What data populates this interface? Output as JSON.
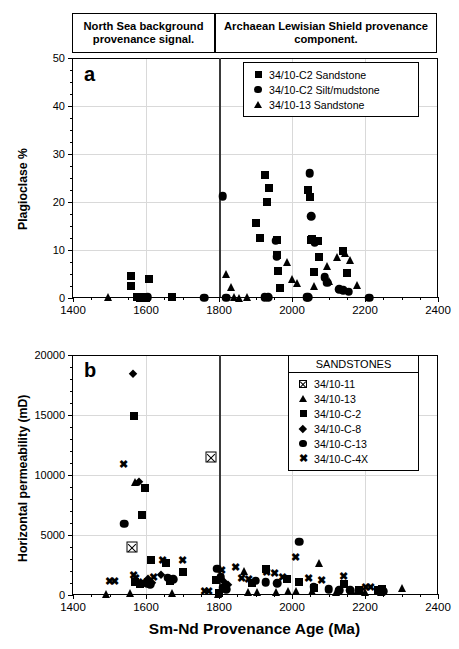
{
  "figure": {
    "header_left": "North Sea background provenance signal.",
    "header_right": "Archaean Lewisian Shield provenance component.",
    "divider_age": 1800,
    "xaxis_title": "Sm-Nd Provenance Age (Ma)"
  },
  "chart_data": [
    {
      "type": "scatter",
      "panel": "a",
      "title": "",
      "xlabel": "Sm-Nd Provenance Age (Ma)",
      "ylabel": "Plagioclase %",
      "xlim": [
        1400,
        2400
      ],
      "ylim": [
        0,
        50
      ],
      "xticks": [
        1400,
        1600,
        1800,
        2000,
        2200,
        2400
      ],
      "yticks": [
        0,
        10,
        20,
        30,
        40,
        50
      ],
      "xminor_step": 50,
      "yminor_step": 2.5,
      "grid": true,
      "legend_position": "top-right",
      "annotations": [
        {
          "text": "a",
          "x": 1432,
          "y": 46
        }
      ],
      "vline": 1800,
      "series": [
        {
          "name": "34/10-C2  Sandstone",
          "marker": "square",
          "points": [
            [
              1558,
              4.5
            ],
            [
              1558,
              2.6
            ],
            [
              1575,
              0.2
            ],
            [
              1583,
              0.1
            ],
            [
              1592,
              0.15
            ],
            [
              1600,
              0.1
            ],
            [
              1608,
              4.0
            ],
            [
              1672,
              0.2
            ],
            [
              1900,
              15.6
            ],
            [
              1913,
              12.5
            ],
            [
              1925,
              25.6
            ],
            [
              1938,
              23.0
            ],
            [
              1932,
              20.0
            ],
            [
              1958,
              12.0
            ],
            [
              1960,
              8.9
            ],
            [
              1962,
              5.6
            ],
            [
              1966,
              2.0
            ],
            [
              2045,
              22.5
            ],
            [
              2048,
              21.0
            ],
            [
              2052,
              12.0
            ],
            [
              2055,
              12.2
            ],
            [
              2060,
              5.4
            ],
            [
              2072,
              11.9
            ],
            [
              2075,
              8.6
            ],
            [
              2140,
              9.8
            ],
            [
              2150,
              5.2
            ]
          ]
        },
        {
          "name": "34/10-C2  Silt/mudstone",
          "marker": "circle",
          "points": [
            [
              1597,
              0.1
            ],
            [
              1605,
              0.15
            ],
            [
              1760,
              0.1
            ],
            [
              1810,
              21.2
            ],
            [
              1820,
              0.1
            ],
            [
              1925,
              0.15
            ],
            [
              1935,
              0.12
            ],
            [
              1942,
              41.3
            ],
            [
              1955,
              11.9
            ],
            [
              1958,
              8.6
            ],
            [
              2040,
              0.15
            ],
            [
              2045,
              0.2
            ],
            [
              2048,
              26.0
            ],
            [
              2052,
              17.0
            ],
            [
              2062,
              11.6
            ],
            [
              2090,
              4.3
            ],
            [
              2096,
              3.2
            ],
            [
              2130,
              1.8
            ],
            [
              2140,
              1.6
            ],
            [
              2155,
              1.3
            ],
            [
              2212,
              0.1
            ]
          ]
        },
        {
          "name": "34/10-13  Sandstone",
          "marker": "triangle",
          "points": [
            [
              1497,
              0.2
            ],
            [
              1820,
              5.0
            ],
            [
              1833,
              2.3
            ],
            [
              1878,
              0.15
            ],
            [
              1840,
              0.2
            ],
            [
              1855,
              0.1
            ],
            [
              1985,
              7.5
            ],
            [
              2000,
              4.0
            ],
            [
              2015,
              3.2
            ],
            [
              2060,
              2.6
            ],
            [
              2095,
              6.7
            ],
            [
              2100,
              3.5
            ],
            [
              2122,
              8.6
            ],
            [
              2145,
              9.4
            ],
            [
              2160,
              8.0
            ],
            [
              2178,
              2.8
            ]
          ]
        }
      ]
    },
    {
      "type": "scatter",
      "panel": "b",
      "title": "SANDSTONES",
      "xlabel": "Sm-Nd Provenance Age (Ma)",
      "ylabel": "Horizontal permeability (mD)",
      "xlim": [
        1400,
        2400
      ],
      "ylim": [
        0,
        20000
      ],
      "xticks": [
        1400,
        1600,
        1800,
        2000,
        2200,
        2400
      ],
      "yticks": [
        0,
        5000,
        10000,
        15000,
        20000
      ],
      "xminor_step": 50,
      "yminor_step": 1000,
      "grid": true,
      "legend_position": "top-right",
      "annotations": [
        {
          "text": "b",
          "x": 1432,
          "y": 18700
        }
      ],
      "vline": 1800,
      "series": [
        {
          "name": "34/10-11",
          "marker": "box-x",
          "points": [
            [
              1563,
              4000
            ],
            [
              1778,
              11500
            ]
          ]
        },
        {
          "name": "34/10-13",
          "marker": "triangle",
          "points": [
            [
              1490,
              120
            ],
            [
              1555,
              150
            ],
            [
              1570,
              9400
            ],
            [
              1672,
              190
            ],
            [
              1797,
              110
            ],
            [
              1868,
              1980
            ],
            [
              1880,
              230
            ],
            [
              1905,
              260
            ],
            [
              1955,
              290
            ],
            [
              1990,
              310
            ],
            [
              2010,
              330
            ],
            [
              2055,
              300
            ],
            [
              2075,
              2700
            ],
            [
              2120,
              280
            ],
            [
              2165,
              330
            ],
            [
              2200,
              290
            ],
            [
              2245,
              250
            ],
            [
              2300,
              600
            ]
          ]
        },
        {
          "name": "34/10-C-2",
          "marker": "square",
          "points": [
            [
              1568,
              14900
            ],
            [
              1597,
              8900
            ],
            [
              1589,
              6700
            ],
            [
              1570,
              1050
            ],
            [
              1583,
              900
            ],
            [
              1613,
              2950
            ],
            [
              1654,
              2700
            ],
            [
              1665,
              1200
            ],
            [
              1700,
              1900
            ],
            [
              1793,
              1250
            ],
            [
              1800,
              200
            ],
            [
              1890,
              1000
            ],
            [
              1930,
              2200
            ],
            [
              1985,
              1350
            ],
            [
              2020,
              1100
            ],
            [
              2060,
              600
            ],
            [
              2142,
              900
            ],
            [
              2183,
              450
            ],
            [
              2236,
              400
            ],
            [
              2247,
              500
            ]
          ]
        },
        {
          "name": "34/10-C-8",
          "marker": "diamond",
          "points": [
            [
              1565,
              18400
            ],
            [
              1580,
              9450
            ],
            [
              1605,
              1350
            ],
            [
              1617,
              1000
            ],
            [
              1640,
              1650
            ],
            [
              1803,
              1400
            ],
            [
              1815,
              1100
            ],
            [
              1826,
              800
            ]
          ]
        },
        {
          "name": "34/10-C-13",
          "marker": "circle",
          "points": [
            [
              1540,
              5950
            ],
            [
              1603,
              1000
            ],
            [
              1611,
              900
            ],
            [
              1660,
              1450
            ],
            [
              1675,
              1300
            ],
            [
              1795,
              2200
            ],
            [
              1805,
              1500
            ],
            [
              1812,
              600
            ],
            [
              1820,
              500
            ],
            [
              1900,
              1200
            ],
            [
              1928,
              1050
            ],
            [
              1960,
              1000
            ],
            [
              2020,
              4450
            ],
            [
              2060,
              700
            ],
            [
              2100,
              500
            ],
            [
              2130,
              420
            ],
            [
              2160,
              400
            ],
            [
              2250,
              330
            ]
          ]
        },
        {
          "name": "34/10-C-4X",
          "marker": "x",
          "points": [
            [
              1500,
              1200
            ],
            [
              1513,
              1150
            ],
            [
              1538,
              10900
            ],
            [
              1567,
              1700
            ],
            [
              1572,
              1450
            ],
            [
              1590,
              1100
            ],
            [
              1620,
              1500
            ],
            [
              1645,
              2900
            ],
            [
              1700,
              2900
            ],
            [
              1760,
              300
            ],
            [
              1770,
              320
            ],
            [
              1808,
              2100
            ],
            [
              1845,
              2300
            ],
            [
              1862,
              1400
            ],
            [
              1880,
              1350
            ],
            [
              1930,
              1900
            ],
            [
              1952,
              1850
            ],
            [
              1975,
              1500
            ],
            [
              2010,
              3200
            ],
            [
              2045,
              1400
            ],
            [
              2080,
              1250
            ],
            [
              2140,
              1600
            ],
            [
              2200,
              700
            ],
            [
              2215,
              650
            ]
          ]
        }
      ]
    }
  ],
  "legend_a": {
    "rows": [
      {
        "symbol": "square",
        "label": "34/10-C2  Sandstone"
      },
      {
        "symbol": "circle",
        "label": "34/10-C2  Silt/mudstone"
      },
      {
        "symbol": "triangle",
        "label": "34/10-13  Sandstone"
      }
    ]
  },
  "legend_b": {
    "title": "SANDSTONES",
    "rows": [
      {
        "symbol": "box-x",
        "label": "34/10-11"
      },
      {
        "symbol": "triangle",
        "label": "34/10-13"
      },
      {
        "symbol": "square",
        "label": "34/10-C-2"
      },
      {
        "symbol": "diamond",
        "label": "34/10-C-8"
      },
      {
        "symbol": "circle",
        "label": "34/10-C-13"
      },
      {
        "symbol": "x",
        "label": "34/10-C-4X"
      }
    ]
  }
}
